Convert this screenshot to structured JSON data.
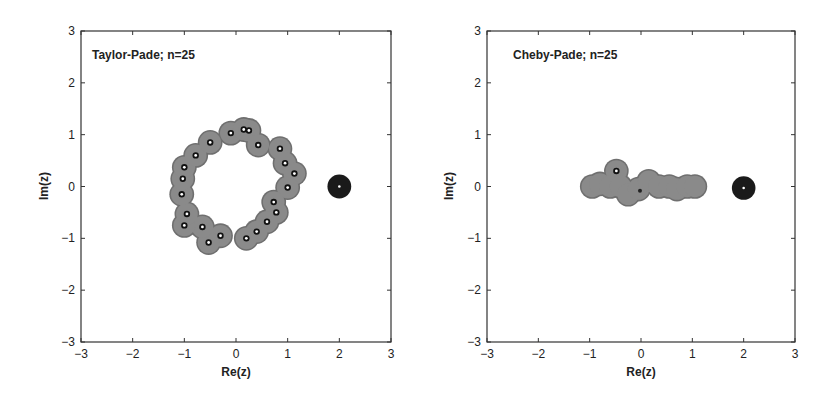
{
  "chart_data": [
    {
      "type": "scatter",
      "title": "Taylor-Pade;   n=25",
      "xlabel": "Re(z)",
      "ylabel": "Im(z)",
      "xlim": [
        -3,
        3
      ],
      "ylim": [
        -3,
        3
      ],
      "xticks": [
        "-3",
        "-2",
        "-1",
        "0",
        "1",
        "2",
        "3"
      ],
      "yticks": [
        "-3",
        "-2",
        "-1",
        "0",
        "1",
        "2",
        "3"
      ],
      "grid": false,
      "legend": null,
      "series": [
        {
          "name": "pseudo-pole regions (gray disks)",
          "color": "#8a8a8a",
          "points": [
            [
              -0.1,
              1.03
            ],
            [
              0.15,
              1.1
            ],
            [
              0.25,
              1.08
            ],
            [
              0.43,
              0.8
            ],
            [
              0.85,
              0.73
            ],
            [
              0.95,
              0.45
            ],
            [
              1.13,
              0.25
            ],
            [
              1.0,
              -0.02
            ],
            [
              0.73,
              -0.3
            ],
            [
              0.78,
              -0.5
            ],
            [
              0.6,
              -0.68
            ],
            [
              0.4,
              -0.87
            ],
            [
              0.2,
              -1.0
            ],
            [
              -0.3,
              -0.95
            ],
            [
              -0.53,
              -1.08
            ],
            [
              -0.65,
              -0.78
            ],
            [
              -1.0,
              -0.75
            ],
            [
              -0.95,
              -0.53
            ],
            [
              -1.05,
              -0.15
            ],
            [
              -1.03,
              0.15
            ],
            [
              -1.0,
              0.37
            ],
            [
              -0.78,
              0.6
            ],
            [
              -0.5,
              0.85
            ]
          ]
        },
        {
          "name": "pole of f (black disk)",
          "color": "#1a1a1a",
          "points": [
            [
              2.0,
              0.0
            ]
          ]
        }
      ]
    },
    {
      "type": "scatter",
      "title": "Cheby-Pade;   n=25",
      "xlabel": "Re(z)",
      "ylabel": "Im(z)",
      "xlim": [
        -3,
        3
      ],
      "ylim": [
        -3,
        3
      ],
      "xticks": [
        "-3",
        "-2",
        "-1",
        "0",
        "1",
        "2",
        "3"
      ],
      "yticks": [
        "-3",
        "-2",
        "-1",
        "0",
        "1",
        "2",
        "3"
      ],
      "grid": false,
      "legend": null,
      "series": [
        {
          "name": "pseudo-pole regions (gray disks)",
          "color": "#8a8a8a",
          "points": [
            [
              -0.48,
              0.3
            ],
            [
              -0.95,
              0.0
            ],
            [
              -0.8,
              0.05
            ],
            [
              -0.6,
              0.0
            ],
            [
              -0.4,
              0.0
            ],
            [
              -0.25,
              -0.15
            ],
            [
              -0.05,
              -0.05
            ],
            [
              0.15,
              0.1
            ],
            [
              0.35,
              0.0
            ],
            [
              0.55,
              0.0
            ],
            [
              0.7,
              -0.05
            ],
            [
              0.9,
              0.0
            ],
            [
              1.05,
              0.0
            ]
          ]
        },
        {
          "name": "pole of f (black disk)",
          "color": "#1a1a1a",
          "points": [
            [
              2.0,
              -0.03
            ]
          ]
        }
      ]
    }
  ],
  "panels": [
    {
      "title": "Taylor-Pade;   n=25",
      "xlabel": "Re(z)",
      "ylabel": "Im(z)"
    },
    {
      "title": "Cheby-Pade;   n=25",
      "xlabel": "Re(z)",
      "ylabel": "Im(z)"
    }
  ],
  "colors": {
    "disk": "#8a8a8a",
    "disk_edge": "#6f6f6f",
    "pole": "#1a1a1a",
    "frame": "#333333"
  }
}
